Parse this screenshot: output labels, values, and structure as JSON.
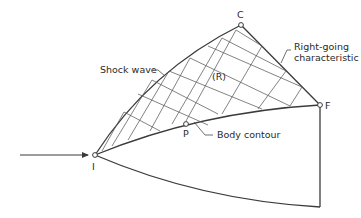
{
  "diagram": {
    "type": "method-of-characteristics flow field",
    "labels": {
      "shock_wave": "Shock wave",
      "region": "(R)",
      "right_going_line1": "Right-going",
      "right_going_line2": "characteristic",
      "body_contour": "Body contour"
    },
    "points": {
      "I": "I",
      "C": "C",
      "F": "F",
      "P": "P"
    },
    "colors": {
      "line": "#3a3a3a",
      "mesh": "#5a5a5a",
      "background": "#ffffff"
    }
  }
}
